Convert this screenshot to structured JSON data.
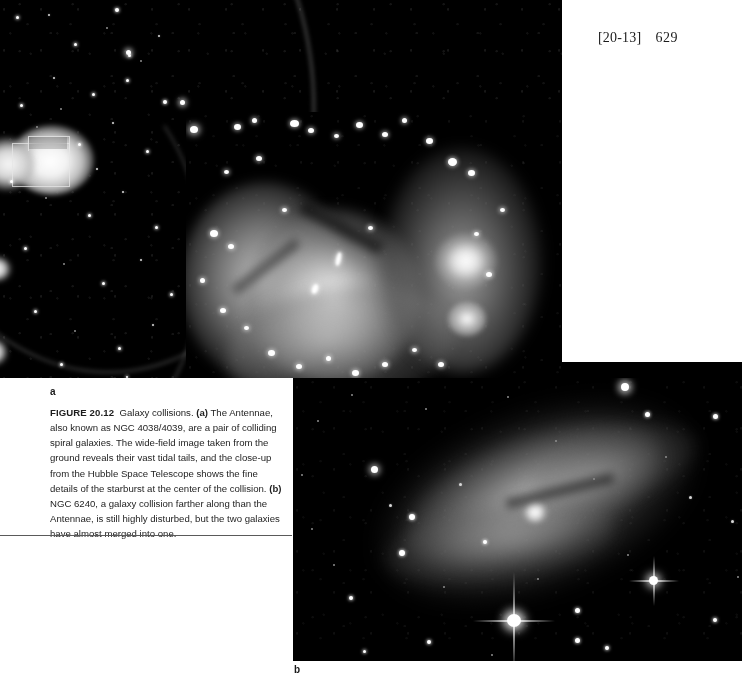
{
  "page": {
    "folio_bracket": "[20-13]",
    "folio_number": "629",
    "background": "#ffffff"
  },
  "figure": {
    "number_label": "FIGURE 20.12",
    "title": "Galaxy collisions.",
    "caption_parts": {
      "part_a_marker": "(a)",
      "part_a_text": " The Antennae, also known as NGC 4038/4039, are a pair of colliding spiral galaxies. The wide-field image taken from the ground reveals their vast tidal tails, and the close-up from the Hubble Space Telescope shows the fine details of the starburst at the center of the collision. ",
      "part_b_marker": "(b)",
      "part_b_text": " NGC 6240, a galaxy collision farther along than the Antennae, is still highly disturbed, but the two galaxies have almost merged into one."
    },
    "full_caption": "FIGURE 20.12  Galaxy collisions. (a) The Antennae, also known as NGC 4038/4039, are a pair of colliding spiral galaxies. The wide-field image taken from the ground reveals their vast tidal tails, and the close-up from the Hubble Space Telescope shows the fine details of the starburst at the center of the collision. (b) NGC 6240, a galaxy collision farther along than the Antennae, is still highly disturbed, but the two galaxies have almost merged into one.",
    "panels": [
      {
        "id": "a",
        "label": "a",
        "subject": "The Antennae (NGC 4038/4039)",
        "description": "Wide-field ground-based image of two colliding spiral galaxies with long tidal tails, overlaid with a Hubble Space Telescope close-up of the starburst core",
        "colors": {
          "sky": "#000000",
          "nebula": "#b9b9b9",
          "star": "#ffffff"
        }
      },
      {
        "id": "b",
        "label": "b",
        "subject": "NGC 6240",
        "description": "Elongated, highly disturbed merged galaxy with a bright foreground star showing diffraction spikes below the nucleus",
        "colors": {
          "sky": "#050505",
          "nebula": "#9a9a9a",
          "star": "#ffffff"
        }
      }
    ]
  }
}
